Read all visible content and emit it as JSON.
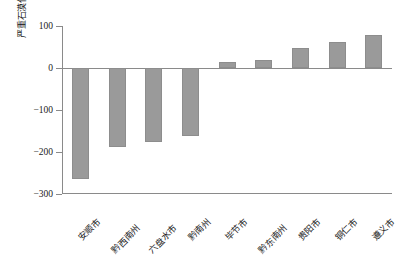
{
  "chart_data": {
    "type": "bar",
    "title": "",
    "subtitle": "",
    "xlabel": "",
    "ylabel": "严重石漠化面积变化/km²",
    "ylabel_text": "严重石漠化面积变化/km",
    "ylabel_exponent": "2",
    "categories": [
      "安顺市",
      "黔西南州",
      "六盘水市",
      "黔南州",
      "毕节市",
      "黔东南州",
      "贵阳市",
      "铜仁市",
      "遵义市"
    ],
    "values": [
      -265,
      -188,
      -175,
      -163,
      15,
      20,
      48,
      63,
      78
    ],
    "ylim": [
      -300,
      100
    ],
    "yticks": [
      100,
      0,
      -100,
      -200,
      -300
    ],
    "ytick_labels": [
      "100",
      "0",
      "−100",
      "−200",
      "−300"
    ],
    "grid": false,
    "legend": false,
    "legend_position": "none",
    "series": [
      {
        "name": "严重石漠化面积变化",
        "values": [
          -265,
          -188,
          -175,
          -163,
          15,
          20,
          48,
          63,
          78
        ]
      }
    ],
    "colors": {
      "bar_fill": "#9a9a9a",
      "bar_edge": "#8d8d8d",
      "axis": "#8a8a8a",
      "text": "#1a1a1a",
      "background": "#ffffff"
    }
  }
}
